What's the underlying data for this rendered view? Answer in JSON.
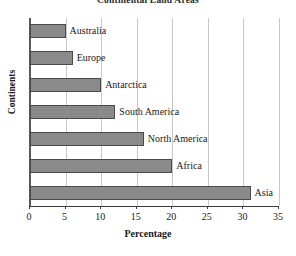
{
  "chart_data": {
    "type": "bar",
    "orientation": "horizontal",
    "title": "Continental Land Areas",
    "xlabel": "Percentage",
    "ylabel": "Continents",
    "categories": [
      "Australia",
      "Europe",
      "Antarctica",
      "South America",
      "North America",
      "Africa",
      "Asia"
    ],
    "values": [
      5,
      6,
      10,
      12,
      16,
      20,
      31
    ],
    "xlim": [
      0,
      35
    ],
    "xticks": [
      "0",
      "5",
      "10",
      "15",
      "20",
      "25",
      "30",
      "35"
    ],
    "xtick_values": [
      0,
      5,
      10,
      15,
      20,
      25,
      30,
      35
    ],
    "grid": "vertical",
    "legend": "none",
    "bar_fill_color": "#8a8a8a",
    "bar_border_color": "#4a4a4a",
    "gridline_color": "#c8c8c8",
    "axis_color": "#3a3a3a",
    "background_color": "#ffffff"
  }
}
